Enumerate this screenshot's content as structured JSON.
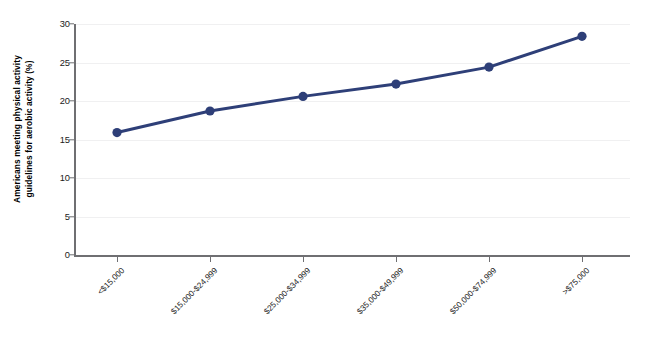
{
  "chart_data": {
    "type": "line",
    "title": "",
    "subtitle": "",
    "xlabel": "",
    "ylabel": "Americans meeting physical activity guidelines for aerobic activity (%)",
    "ylabel_lines": [
      "Americans meeting physical activity",
      "guidelines for aerobic activity (%)"
    ],
    "categories": [
      "<$15,000",
      "$15,000-$24,999",
      "$25,000-$34,999",
      "$35,000-$49,999",
      "$50,000-$74,999",
      ">$75,000"
    ],
    "values": [
      15.9,
      18.7,
      20.6,
      22.2,
      24.4,
      28.4
    ],
    "series": [
      {
        "name": "Americans meeting physical activity guidelines for aerobic activity (%)",
        "values": [
          15.9,
          18.7,
          20.6,
          22.2,
          24.4,
          28.4
        ],
        "color": "#2e3f78",
        "marker": "circle",
        "line_width": 3
      }
    ],
    "ylim": [
      0,
      30
    ],
    "yticks": [
      0,
      5,
      10,
      15,
      20,
      25,
      30
    ],
    "ytick_labels": [
      "0",
      "5",
      "10",
      "15",
      "20",
      "25",
      "30"
    ],
    "grid": true,
    "grid_axis": "y",
    "grid_color": "#f0f0f1",
    "legend": false,
    "legend_position": "none",
    "axis_color": "#6f6f72",
    "background": "#ffffff",
    "xtick_label_rotation": -45
  },
  "figure": {
    "accent_color": "#2e3f78",
    "axis_color": "#6f6f72",
    "grid_color": "#f0f0f1",
    "text_color": "#1b1b1b",
    "background": "#ffffff"
  },
  "bottom_caption": ""
}
